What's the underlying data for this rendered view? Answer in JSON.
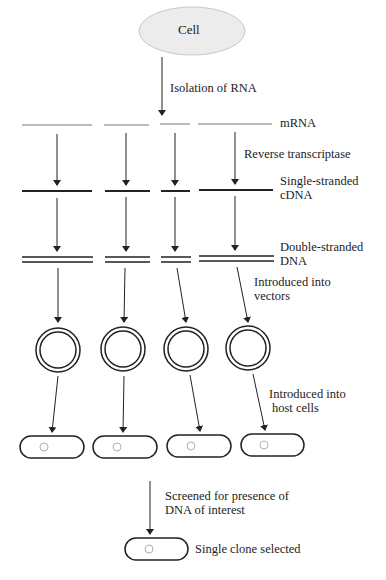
{
  "diagram": {
    "cell_label": "Cell",
    "steps": {
      "isolation": "Isolation of RNA",
      "mrna": "mRNA",
      "reverse_transcriptase": "Reverse transcriptase",
      "ss_cdna_line1": "Single-stranded",
      "ss_cdna_line2": "cDNA",
      "ds_dna_line1": "Double-stranded",
      "ds_dna_line2": "DNA",
      "vectors_line1": "Introduced into",
      "vectors_line2": "vectors",
      "host_line1": "Introduced into",
      "host_line2": "host cells",
      "screen_line1": "Screened for presence of",
      "screen_line2": "DNA of interest",
      "selected": "Single clone selected"
    },
    "colors": {
      "cell_fill": "#ececec",
      "cell_stroke": "#c8c8c8",
      "line": "#222222",
      "thin_line": "#555555",
      "bacterium_dot": "#b0b0b0"
    }
  }
}
